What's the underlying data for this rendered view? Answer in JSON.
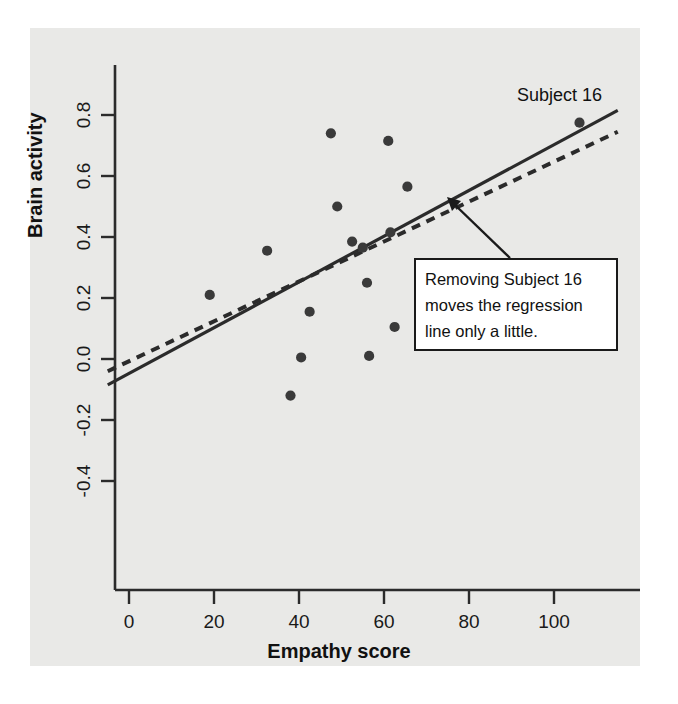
{
  "figure": {
    "background_color": "#ffffff",
    "panel_color": "#e9e9e7",
    "ink_color": "#2b2b2b"
  },
  "axis": {
    "y_title": "Brain activity",
    "x_title": "Empathy score"
  },
  "annotation": {
    "box_line_1": "Removing Subject 16",
    "box_line_2": "moves the regression",
    "box_line_3": "line only a little.",
    "point_label": "Subject 16"
  },
  "chart_data": {
    "type": "scatter",
    "title": "",
    "xlabel": "Empathy score",
    "ylabel": "Brain activity",
    "xlim": [
      -5,
      115
    ],
    "ylim": [
      -0.52,
      0.92
    ],
    "xticks": [
      0,
      20,
      40,
      60,
      80,
      100
    ],
    "xtick_labels": [
      "0",
      "20",
      "40",
      "60",
      "80",
      "100"
    ],
    "yticks": [
      -0.4,
      -0.2,
      0.0,
      0.2,
      0.4,
      0.6,
      0.8
    ],
    "ytick_labels": [
      "-0.4",
      "-0.2",
      "0.0",
      "0.2",
      "0.4",
      "0.6",
      "0.8"
    ],
    "grid": false,
    "legend": "none",
    "marker_color": "#3a3a3a",
    "marker_size": 9,
    "points": [
      {
        "x": 19.0,
        "y": 0.21
      },
      {
        "x": 32.5,
        "y": 0.355
      },
      {
        "x": 38.0,
        "y": -0.12
      },
      {
        "x": 40.5,
        "y": 0.005
      },
      {
        "x": 42.5,
        "y": 0.155
      },
      {
        "x": 47.5,
        "y": 0.74
      },
      {
        "x": 49.0,
        "y": 0.5
      },
      {
        "x": 52.5,
        "y": 0.385
      },
      {
        "x": 55.0,
        "y": 0.365
      },
      {
        "x": 56.0,
        "y": 0.25
      },
      {
        "x": 56.5,
        "y": 0.01
      },
      {
        "x": 61.0,
        "y": 0.715
      },
      {
        "x": 61.5,
        "y": 0.415
      },
      {
        "x": 62.5,
        "y": 0.105
      },
      {
        "x": 65.5,
        "y": 0.565
      },
      {
        "x": 106.0,
        "y": 0.775
      }
    ],
    "series": [
      {
        "name": "Regression line (all subjects)",
        "type": "line",
        "style": "solid",
        "color": "#2b2b2b",
        "endpoints": [
          {
            "x": -5,
            "y": -0.085
          },
          {
            "x": 115,
            "y": 0.815
          }
        ]
      },
      {
        "name": "Regression line (Subject 16 removed)",
        "type": "line",
        "style": "dashed",
        "color": "#2b2b2b",
        "endpoints": [
          {
            "x": -5,
            "y": -0.04
          },
          {
            "x": 115,
            "y": 0.745
          }
        ]
      }
    ],
    "annotations": [
      {
        "text": "Subject 16",
        "x": 106.0,
        "y": 0.775,
        "placement": "above-left"
      },
      {
        "text": "Removing Subject 16 moves the regression line only a little.",
        "points_to": {
          "x": 87,
          "y": 0.555
        }
      }
    ]
  }
}
